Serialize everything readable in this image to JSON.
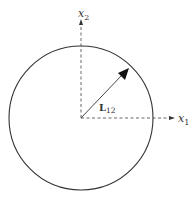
{
  "diagram": {
    "axes": {
      "x1": {
        "label": "x",
        "subscript": "1"
      },
      "x2": {
        "label": "x",
        "subscript": "2"
      }
    },
    "vector": {
      "label": "L",
      "subscript": "12"
    },
    "circle": {
      "stroke": "#333333"
    },
    "colors": {
      "line": "#333333",
      "background": "#ffffff"
    }
  }
}
